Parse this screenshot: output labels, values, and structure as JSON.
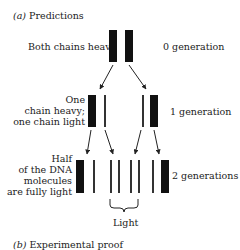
{
  "section_a": {
    "label": "(a)",
    "title": "Predictions"
  },
  "generations": [
    {
      "left_label_lines": [
        "Both chains heavy"
      ],
      "right_label": "0 generation"
    },
    {
      "left_label_lines": [
        "One",
        "chain heavy;",
        "one chain light"
      ],
      "right_label": "1 generation"
    },
    {
      "left_label_lines": [
        "Half",
        "of the DNA",
        "molecules",
        "are fully light"
      ],
      "right_label": "2 generations"
    }
  ],
  "brace_label": "Light",
  "section_b": {
    "label": "(b)",
    "title": "Experimental proof"
  },
  "colors": {
    "strand": "#111111",
    "light_strand": "#333333",
    "text": "#222222"
  }
}
